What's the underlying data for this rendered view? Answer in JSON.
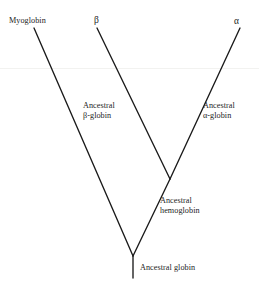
{
  "figure": {
    "type": "phylogenetic-tree",
    "background_color": "#ffffff",
    "line_color": "#1a1a1a",
    "text_color": "#1d1d1d",
    "width": 259,
    "height": 290
  },
  "tips": [
    {
      "id": "myoglobin",
      "label": "Myoglobin",
      "x": 34,
      "y": 28
    },
    {
      "id": "beta",
      "label": "β",
      "x": 97,
      "y": 28
    },
    {
      "id": "alpha",
      "label": "α",
      "x": 240,
      "y": 28
    }
  ],
  "internal_nodes": [
    {
      "id": "ancestral-beta-globin",
      "line1": "Ancestral",
      "line2": "β-globin"
    },
    {
      "id": "ancestral-alpha-globin",
      "line1": "Ancestral",
      "line2": "α-globin"
    },
    {
      "id": "ancestral-hemoglobin",
      "line1": "Ancestral",
      "line2": "hemoglobin",
      "x": 170,
      "y": 179
    },
    {
      "id": "ancestral-globin",
      "line1": "Ancestral  globin",
      "x": 133,
      "y": 256
    }
  ],
  "branches": [
    {
      "id": "root-stem",
      "x1": 133,
      "y1": 256,
      "x2": 133,
      "y2": 278
    },
    {
      "id": "myoglobin-branch",
      "x1": 133,
      "y1": 256,
      "x2": 34,
      "y2": 28
    },
    {
      "id": "hemoglobin-branch",
      "x1": 133,
      "y1": 256,
      "x2": 170,
      "y2": 179
    },
    {
      "id": "beta-globin-branch",
      "x1": 170,
      "y1": 179,
      "x2": 97,
      "y2": 28
    },
    {
      "id": "alpha-globin-branch",
      "x1": 170,
      "y1": 179,
      "x2": 240,
      "y2": 28
    }
  ]
}
